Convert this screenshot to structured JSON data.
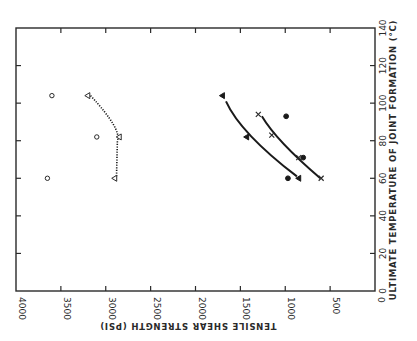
{
  "chart_data": {
    "type": "scatter",
    "orientation": "rotated 90 degrees clockwise (temperature axis vertical at right, strength axis horizontal at bottom reading right-to-left)",
    "title": "",
    "xlabel": "ULTIMATE TEMPERATURE OF JOINT FORMATION (°C)",
    "ylabel": "TENSILE SHEAR STRENGTH (PSI)",
    "xlim": [
      0,
      140
    ],
    "ylim": [
      0,
      4000
    ],
    "x_ticks": [
      0,
      20,
      40,
      60,
      80,
      100,
      120,
      140
    ],
    "y_ticks": [
      0,
      500,
      1000,
      1500,
      2000,
      2500,
      3000,
      3500,
      4000
    ],
    "grid": false,
    "legend": null,
    "series": [
      {
        "name": "open circles",
        "marker": "open-circle",
        "line": "none",
        "points": [
          [
            60,
            3650
          ],
          [
            82,
            3100
          ],
          [
            104,
            3600
          ]
        ]
      },
      {
        "name": "open triangles",
        "marker": "open-triangle",
        "line": "dotted",
        "points": [
          [
            60,
            2900
          ],
          [
            82,
            2850
          ],
          [
            104,
            3200
          ]
        ]
      },
      {
        "name": "filled triangles",
        "marker": "filled-triangle",
        "line": "solid",
        "points": [
          [
            60,
            850
          ],
          [
            82,
            1430
          ],
          [
            104,
            1700
          ]
        ]
      },
      {
        "name": "crosses",
        "marker": "x",
        "line": "solid",
        "points": [
          [
            60,
            600
          ],
          [
            71,
            850
          ],
          [
            83,
            1150
          ],
          [
            94,
            1300
          ]
        ]
      },
      {
        "name": "filled circles",
        "marker": "filled-circle",
        "line": "none",
        "points": [
          [
            60,
            970
          ],
          [
            71,
            800
          ],
          [
            93,
            990
          ]
        ]
      }
    ]
  },
  "axes": {
    "temperature_label": "ULTIMATE TEMPERATURE OF JOINT FORMATION (°C)",
    "strength_label": "TENSILE SHEAR STRENGTH (PSI)",
    "temperature_ticks": [
      "0",
      "20",
      "40",
      "60",
      "80",
      "100",
      "120",
      "140"
    ],
    "strength_ticks": [
      "4000",
      "3500",
      "3000",
      "2500",
      "2000",
      "1500",
      "1000",
      "500",
      "0"
    ]
  },
  "colors": {
    "ink": "#1a1a1a",
    "background": "#ffffff"
  }
}
